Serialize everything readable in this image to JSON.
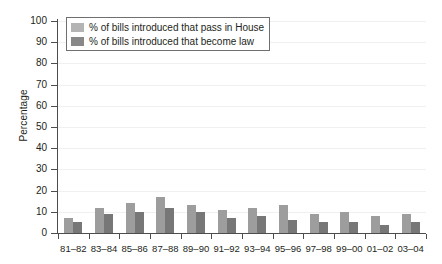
{
  "chart_data": {
    "type": "bar",
    "title": "",
    "xlabel": "",
    "ylabel": "Percentage",
    "ylim": [
      0,
      100
    ],
    "yticks": [
      0,
      10,
      20,
      30,
      40,
      50,
      60,
      70,
      80,
      90,
      100
    ],
    "grid": true,
    "legend_position": "top-left",
    "categories": [
      "81–82",
      "83–84",
      "85–86",
      "87–88",
      "89–90",
      "91–92",
      "93–94",
      "95–96",
      "97–98",
      "99–00",
      "01–02",
      "03–04"
    ],
    "series": [
      {
        "name": "% of bills introduced that pass in House",
        "color": "#9d9d9d",
        "values": [
          7,
          12,
          14,
          17,
          13,
          11,
          12,
          13,
          9,
          10,
          8,
          9
        ]
      },
      {
        "name": "% of bills introduced that become law",
        "color": "#777777",
        "values": [
          5,
          9,
          10,
          12,
          10,
          7,
          8,
          6,
          5,
          5,
          4,
          5
        ]
      }
    ]
  },
  "legend": {
    "items": [
      {
        "label": "% of bills introduced that pass in House"
      },
      {
        "label": "% of bills introduced that become law"
      }
    ]
  },
  "axes": {
    "y_title": "Percentage"
  }
}
